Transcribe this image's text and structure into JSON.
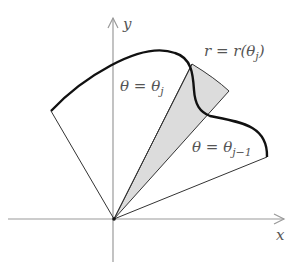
{
  "diagram": {
    "axes": {
      "x_label": "x",
      "y_label": "y"
    },
    "curve_label": "r = r(θ",
    "curve_label_sub": "j",
    "curve_label_close": ")",
    "ray_j_label": "θ = θ",
    "ray_j_sub": "j",
    "ray_j1_label": "θ = θ",
    "ray_j1_sub": "j−1",
    "colors": {
      "axis": "#9a9a9a",
      "curve": "#111111",
      "ray": "#333333",
      "shade": "#d9d9d9",
      "text": "#555555"
    }
  }
}
